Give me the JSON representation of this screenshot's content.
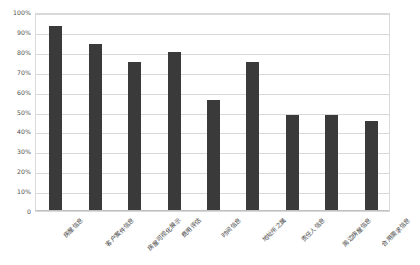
{
  "chart_data": {
    "type": "bar",
    "title": "",
    "subtitle": "",
    "xlabel": "",
    "ylabel": "",
    "ylim": [
      0,
      100
    ],
    "grid": true,
    "legend": false,
    "legend_position": "none",
    "orientation": "vertical",
    "bar_color": "#3a3a3a",
    "gridline_color": "#d9d9d9",
    "axis_label_color": "#4d4d4d",
    "value_unit": "%",
    "categories": [
      "房屋信息",
      "客户案件信息",
      "房屋可视化展示",
      "费用评估",
      "时间信息",
      "地址所之属",
      "责任人信息",
      "周边房屋信息",
      "合用需求信息"
    ],
    "values": [
      93,
      84,
      75,
      80,
      56,
      75,
      48,
      48,
      45
    ],
    "ytick_labels": [
      "100%",
      "90%",
      "80%",
      "70%",
      "60%",
      "50%",
      "40%",
      "30%",
      "20%",
      "10%",
      "0"
    ],
    "ytick_values": [
      100,
      90,
      80,
      70,
      60,
      50,
      40,
      30,
      20,
      10,
      0
    ]
  }
}
